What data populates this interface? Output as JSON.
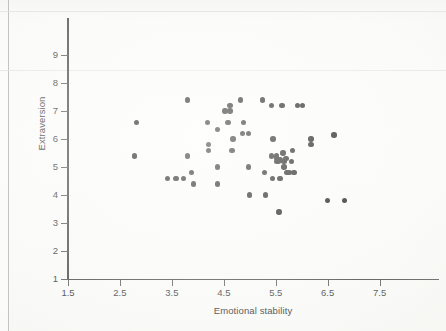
{
  "chart_data": {
    "type": "scatter",
    "title": "",
    "subtitle": "",
    "xlabel": "Emotional stability",
    "ylabel": "Extraversion",
    "xlim": [
      1.5,
      7.95
    ],
    "ylim": [
      1.0,
      9.4
    ],
    "xticks": [
      1.5,
      2.5,
      3.5,
      4.5,
      5.5,
      6.5,
      7.5
    ],
    "xtick_labels": [
      "1.5",
      "2.5",
      "3.5",
      "4.5",
      "5.5",
      "6.5",
      "7.5"
    ],
    "yticks": [
      1,
      2,
      3,
      4,
      5,
      6,
      7,
      8,
      9
    ],
    "ytick_labels": [
      "1",
      "2",
      "3",
      "4",
      "5",
      "6",
      "7",
      "8",
      "9"
    ],
    "grid": false,
    "legend": null,
    "marker": {
      "shape": "circle",
      "color": "#141414",
      "size_px": 5.4
    },
    "points": [
      [
        2.82,
        6.6
      ],
      [
        2.78,
        5.4
      ],
      [
        3.42,
        4.6
      ],
      [
        3.58,
        4.6
      ],
      [
        3.72,
        4.6
      ],
      [
        3.8,
        7.4
      ],
      [
        3.8,
        5.4
      ],
      [
        3.88,
        4.8
      ],
      [
        3.92,
        4.4
      ],
      [
        4.18,
        6.6
      ],
      [
        4.2,
        5.8
      ],
      [
        4.2,
        5.6
      ],
      [
        4.38,
        6.35
      ],
      [
        4.38,
        5.0
      ],
      [
        4.38,
        4.4
      ],
      [
        4.52,
        7.0
      ],
      [
        4.58,
        6.6
      ],
      [
        4.62,
        7.2
      ],
      [
        4.62,
        7.0
      ],
      [
        4.68,
        6.0
      ],
      [
        4.66,
        5.6
      ],
      [
        4.82,
        7.4
      ],
      [
        4.88,
        6.6
      ],
      [
        4.86,
        6.2
      ],
      [
        4.98,
        6.2
      ],
      [
        4.98,
        5.0
      ],
      [
        5.0,
        4.0
      ],
      [
        5.25,
        7.4
      ],
      [
        5.28,
        4.8
      ],
      [
        5.3,
        4.0
      ],
      [
        5.42,
        7.2
      ],
      [
        5.45,
        6.0
      ],
      [
        5.42,
        5.4
      ],
      [
        5.44,
        4.6
      ],
      [
        5.52,
        5.4
      ],
      [
        5.52,
        5.3
      ],
      [
        5.52,
        5.2
      ],
      [
        5.55,
        5.2
      ],
      [
        5.58,
        5.25
      ],
      [
        5.58,
        4.6
      ],
      [
        5.56,
        3.4
      ],
      [
        5.62,
        7.2
      ],
      [
        5.64,
        5.5
      ],
      [
        5.66,
        5.2
      ],
      [
        5.66,
        5.0
      ],
      [
        5.7,
        5.3
      ],
      [
        5.72,
        4.8
      ],
      [
        5.76,
        4.8
      ],
      [
        5.8,
        5.2
      ],
      [
        5.82,
        5.6
      ],
      [
        5.84,
        4.8
      ],
      [
        5.86,
        4.8
      ],
      [
        5.92,
        7.2
      ],
      [
        6.02,
        7.2
      ],
      [
        6.18,
        6.0
      ],
      [
        6.18,
        5.8
      ],
      [
        6.5,
        3.8
      ],
      [
        6.62,
        6.15
      ],
      [
        6.82,
        3.8
      ]
    ],
    "n_points": 59
  }
}
